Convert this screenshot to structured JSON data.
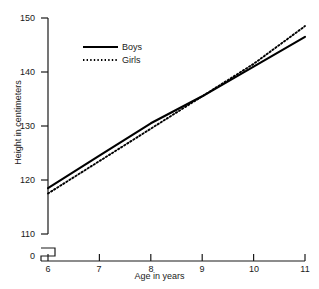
{
  "chart_data": {
    "type": "line",
    "title": "",
    "xlabel": "Age in years",
    "ylabel": "Height in centimeters",
    "x": [
      6,
      7,
      8,
      9,
      10,
      11
    ],
    "xlim": [
      6,
      11
    ],
    "ylim": [
      110,
      150
    ],
    "y_axis_break": true,
    "y_break_label": "0",
    "grid": false,
    "legend_position": "upper-left",
    "xticks": [
      "6",
      "7",
      "8",
      "9",
      "10",
      "11"
    ],
    "yticks": [
      "110",
      "120",
      "130",
      "140",
      "150"
    ],
    "series": [
      {
        "name": "Boys",
        "style": "solid",
        "color": "#000000",
        "values": [
          118.5,
          124.5,
          130.5,
          135.5,
          141.0,
          146.5
        ]
      },
      {
        "name": "Girls",
        "style": "dotted",
        "color": "#000000",
        "values": [
          117.5,
          123.5,
          129.5,
          135.5,
          141.5,
          148.5
        ]
      }
    ]
  },
  "axis": {
    "y_title": "Height in centimeters",
    "x_title": "Age in years",
    "y_zero_label": "0"
  },
  "legend": {
    "entries": [
      {
        "label": "Boys",
        "style": "solid"
      },
      {
        "label": "Girls",
        "style": "dotted"
      }
    ]
  }
}
